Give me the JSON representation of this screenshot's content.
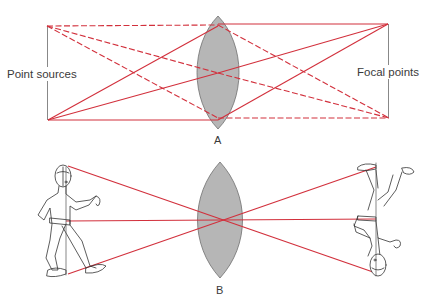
{
  "diagram": {
    "colors": {
      "ray": "#d2303c",
      "lens_fill": "#b6b6b6",
      "lens_stroke": "#6f6f6f",
      "line": "#7a7a7a",
      "text": "#3a3a3a",
      "figure": "#333333"
    },
    "panel_a": {
      "label": "A",
      "left_label": "Point sources",
      "right_label": "Focal points"
    },
    "panel_b": {
      "label": "B"
    }
  }
}
